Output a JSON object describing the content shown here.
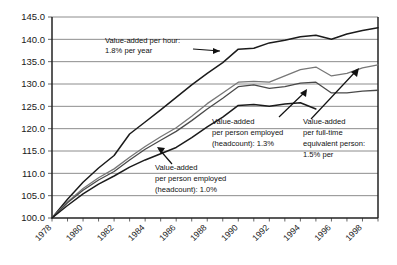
{
  "chart_data": {
    "type": "line",
    "title": "",
    "xlabel": "",
    "ylabel": "",
    "ylim": [
      100.0,
      145.0
    ],
    "ytick_step": 5.0,
    "ytick_labels": [
      "100.0",
      "105.0",
      "110.0",
      "115.0",
      "120.0",
      "125.0",
      "130.0",
      "135.0",
      "140.0",
      "145.0"
    ],
    "xlim": [
      1978,
      1999
    ],
    "xtick_labels": [
      "1978",
      "1980",
      "1982",
      "1984",
      "1986",
      "1988",
      "1990",
      "1992",
      "1994",
      "1996",
      "1998"
    ],
    "x": [
      1978,
      1979,
      1980,
      1981,
      1982,
      1983,
      1984,
      1985,
      1986,
      1987,
      1988,
      1989,
      1990,
      1991,
      1992,
      1993,
      1994,
      1995,
      1996,
      1997,
      1998,
      1999
    ],
    "grid": "horizontal",
    "legend": "none (inline annotations with arrows)",
    "series": [
      {
        "name": "Value-added per hour",
        "growth": "1.8% per year",
        "color": "#1b1b1b",
        "values": [
          100.0,
          104.2,
          108.0,
          111.2,
          114.0,
          118.8,
          121.5,
          124.2,
          127.0,
          129.8,
          132.4,
          134.8,
          137.8,
          138.0,
          139.2,
          139.8,
          140.6,
          140.9,
          140.0,
          141.2,
          142.0,
          142.6
        ]
      },
      {
        "name": "Value-added per full-time equivalent person",
        "growth": "1.5% per",
        "color": "#777777",
        "values": [
          100.0,
          103.6,
          106.6,
          109.0,
          111.0,
          113.6,
          116.0,
          118.2,
          120.2,
          122.8,
          125.6,
          128.0,
          130.4,
          130.6,
          130.4,
          131.8,
          133.2,
          133.8,
          131.8,
          132.4,
          133.6,
          134.3
        ]
      },
      {
        "name": "Value-added per person employed (headcount) 1.3%",
        "growth": "1.3%",
        "color": "#4a4a4a",
        "values": [
          100.0,
          103.4,
          106.2,
          108.5,
          110.4,
          113.0,
          115.4,
          117.4,
          119.4,
          121.8,
          124.4,
          126.8,
          129.4,
          129.8,
          129.0,
          129.4,
          130.2,
          130.4,
          128.0,
          128.0,
          128.4,
          128.6
        ]
      },
      {
        "name": "Value-added per person employed (headcount) 1.0%",
        "growth": "1.0%",
        "color": "#1b1b1b",
        "values": [
          100.0,
          102.8,
          105.4,
          107.6,
          109.4,
          111.4,
          113.0,
          114.4,
          115.8,
          118.0,
          120.4,
          122.6,
          125.2,
          125.4,
          125.0,
          125.5,
          125.8,
          124.4,
          null,
          null,
          null,
          null
        ]
      }
    ],
    "annotations": [
      {
        "id": "anno-per-hour",
        "lines": [
          "Value-added per hour:",
          "1.8% per year"
        ]
      },
      {
        "id": "anno-headcount-13",
        "lines": [
          "Value-added",
          "per person employed",
          "(headcount): 1.3%"
        ]
      },
      {
        "id": "anno-fte-15",
        "lines": [
          "Value-added",
          "per full-time",
          "equivalent person:",
          "1.5% per"
        ]
      },
      {
        "id": "anno-headcount-10",
        "lines": [
          "Value-added",
          "per person employed",
          "(headcount): 1.0%"
        ]
      }
    ]
  }
}
